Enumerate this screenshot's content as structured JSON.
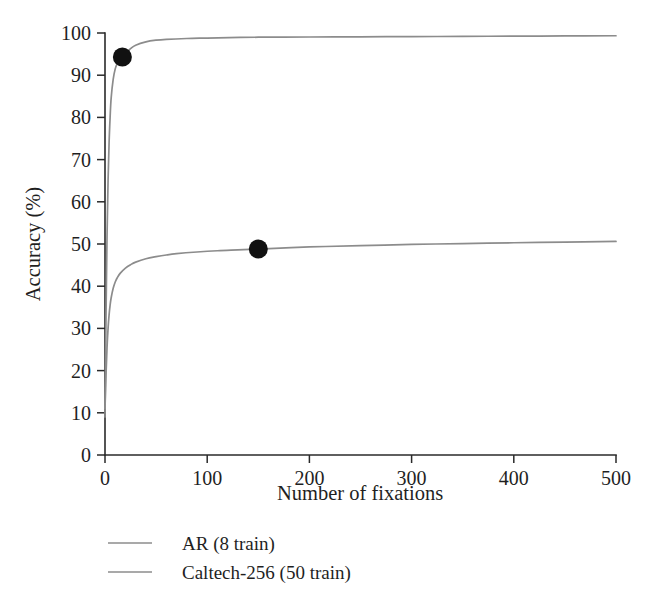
{
  "chart_data": {
    "type": "line",
    "title": "",
    "subtitle": "",
    "xlabel": "Number of fixations",
    "ylabel": "Accuracy (%)",
    "xlim": [
      0,
      500
    ],
    "ylim": [
      0,
      100
    ],
    "xticks": [
      0,
      100,
      200,
      300,
      400,
      500
    ],
    "yticks": [
      0,
      10,
      20,
      30,
      40,
      50,
      60,
      70,
      80,
      90,
      100
    ],
    "xtick_labels": [
      "0",
      "100",
      "200",
      "300",
      "400",
      "500"
    ],
    "ytick_labels": [
      "0",
      "10",
      "20",
      "30",
      "40",
      "50",
      "60",
      "70",
      "80",
      "90",
      "100"
    ],
    "grid": false,
    "legend_position": "below-left",
    "line_color": "#8c8c8c",
    "marker_color": "#111111",
    "axis_color": "#2a2a2a",
    "series": [
      {
        "name": "AR (8 train)",
        "color": "#8c8c8c",
        "x": [
          0,
          1,
          2,
          3,
          4,
          5,
          6,
          8,
          10,
          12,
          14,
          17,
          20,
          25,
          30,
          40,
          50,
          60,
          80,
          100,
          150,
          200,
          250,
          300,
          350,
          400,
          450,
          500
        ],
        "y": [
          9.0,
          33.0,
          52.0,
          65.0,
          74.0,
          80.0,
          84.5,
          89.0,
          91.5,
          92.8,
          93.6,
          94.3,
          95.2,
          96.3,
          97.1,
          97.9,
          98.3,
          98.5,
          98.7,
          98.8,
          99.0,
          99.05,
          99.1,
          99.15,
          99.2,
          99.25,
          99.3,
          99.35
        ],
        "marker_point": {
          "x": 17,
          "y": 94.3
        }
      },
      {
        "name": "Caltech-256 (50 train)",
        "color": "#8c8c8c",
        "x": [
          0,
          1,
          2,
          3,
          4,
          5,
          6,
          8,
          10,
          12,
          15,
          20,
          25,
          30,
          40,
          50,
          60,
          70,
          90,
          110,
          130,
          150,
          200,
          250,
          300,
          350,
          400,
          450,
          500
        ],
        "y": [
          11.0,
          19.0,
          25.5,
          30.0,
          33.2,
          35.5,
          37.2,
          39.5,
          41.0,
          42.0,
          43.1,
          44.3,
          45.1,
          45.7,
          46.5,
          47.0,
          47.4,
          47.7,
          48.1,
          48.4,
          48.6,
          48.8,
          49.3,
          49.6,
          49.9,
          50.1,
          50.3,
          50.45,
          50.6
        ],
        "marker_point": {
          "x": 150,
          "y": 48.8
        }
      }
    ],
    "legend": [
      {
        "label": "AR (8 train)",
        "color": "#8c8c8c"
      },
      {
        "label": "Caltech-256 (50 train)",
        "color": "#8c8c8c"
      }
    ]
  }
}
